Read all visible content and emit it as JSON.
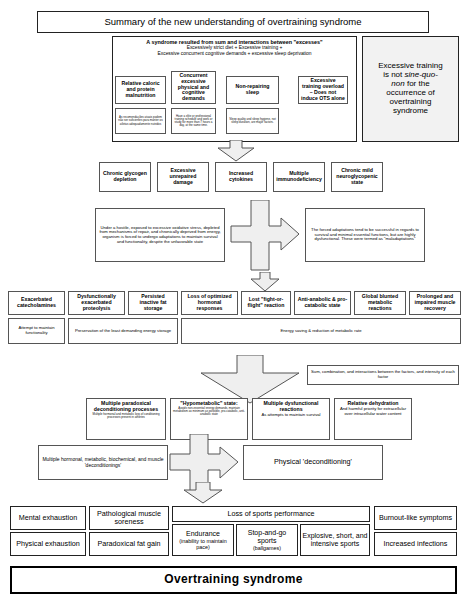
{
  "title": "Summary of the new understanding of overtraining syndrome",
  "excess_block": {
    "heading": "A syndrome resulted from sum and interactions between \"excesses\"",
    "line2": "Excessively strict diet + Excessive training +",
    "line3": "Excessive concurrent cognitive demands + excessive sleep deprivation"
  },
  "sine_quo_non": {
    "l1": "Excessive training",
    "l2": "is not ",
    "l2i": "sine-quo-",
    "l3i": "non",
    "l3": " for the",
    "l4": "occurrence of",
    "l5": "overtraining",
    "l6": "syndrome"
  },
  "excess_row": [
    {
      "title": "Relative caloric and protein malnutrition",
      "note": "As recomendações atuais podem não ser suficientes para manter os atletas adequadamente nutridos"
    },
    {
      "title": "Concurrent excessive physical and cognitive demands",
      "note": "Have a elite or professional training schedule and work or study for more than 7 hours a day, at the same time."
    },
    {
      "title": "Non-repairing sleep",
      "note": "Sleep quality and sleep hygiene, not sleep duration, are major factors."
    },
    {
      "title": "Excessive training overload – Does not induce OTS alone",
      "note": ""
    }
  ],
  "consequences_row": [
    "Chronic glycogen depletion",
    "Excessive unrepaired damage",
    "Increased cytokines",
    "Multiple immunodeficiency",
    "Chronic mild neuroglycopenic state"
  ],
  "adaptation": {
    "left": "Under a hostile, exposed to excessive oxidative stress, depleted from mechanisms of repair, and chronically deprived from energy, organism is forced to undergo adaptations to maintain survival and functionality, despite the unfavorable state",
    "right": "The forced adaptations tend to be successful in regards to survival and minimal essential functions, but are highly dysfunctional. These were termed as \"maladaptations\""
  },
  "maladaptations": [
    {
      "title": "Exacerbated catecholamines",
      "note": "Attempt to maintain functionality"
    },
    {
      "title": "Dysfunctionally exacerbated proteolysis",
      "note": ""
    },
    {
      "title": "Persisted inactive fat storage",
      "note": ""
    },
    {
      "title": "Loss of optimized hormonal responses",
      "note": ""
    },
    {
      "title": "Lost \"fight-or-flight\" reaction",
      "note": ""
    },
    {
      "title": "Anti-anabolic & pro-catabolic state",
      "note": ""
    },
    {
      "title": "Global blunted metabolic reactions",
      "note": ""
    },
    {
      "title": "Prolonged and impaired muscle recovery",
      "note": ""
    }
  ],
  "maladaptation_notes": {
    "left": "Preservation of the least demanding energy storage",
    "right": "Energy saving & reduction of metabolic rate"
  },
  "sum_note": "Sum, combination, and interactions between the factors, and intensity of each factor",
  "deconditioning_row": [
    {
      "title": "Multiple paradoxical deconditioning processes",
      "note": "Multiple hormonal and metabolic loss of conditioning processes present in athletes"
    },
    {
      "title": "\"Hypometabolic\" state:",
      "note": "Avoids non-essential energy demands, maintain metabolism as minimum as possible, pro-catabolic, anti-anabolic state"
    },
    {
      "title": "Multiple dysfunctional reactions",
      "note": "As attempts to maintain survival"
    },
    {
      "title": "Relative dehydration",
      "note": "And harmful priority for extracellular over intracellular water content"
    }
  ],
  "decond_summary": "Multiple hormonal, metabolic, biochemical, and muscle 'deconditionings'",
  "physical_decond": "Physical 'deconditioning'",
  "outcomes": {
    "left_col": [
      "Mental exhaustion",
      "Physical exhaustion"
    ],
    "mid_col": [
      "Pathological muscle soreness",
      "Paradoxical fat gain"
    ],
    "sports_header": "Loss of sports performance",
    "sports": [
      {
        "l1": "Endurance",
        "l2": "(inability to maintain pace)"
      },
      {
        "l1": "Stop-and-go sports",
        "l2": "(ballgames)"
      },
      {
        "l1": "Explosive, short, and intensive sports",
        "l2": ""
      }
    ],
    "right_col": [
      "Burnout-like symptoms",
      "Increased infections"
    ]
  },
  "final": "Overtraining syndrome"
}
